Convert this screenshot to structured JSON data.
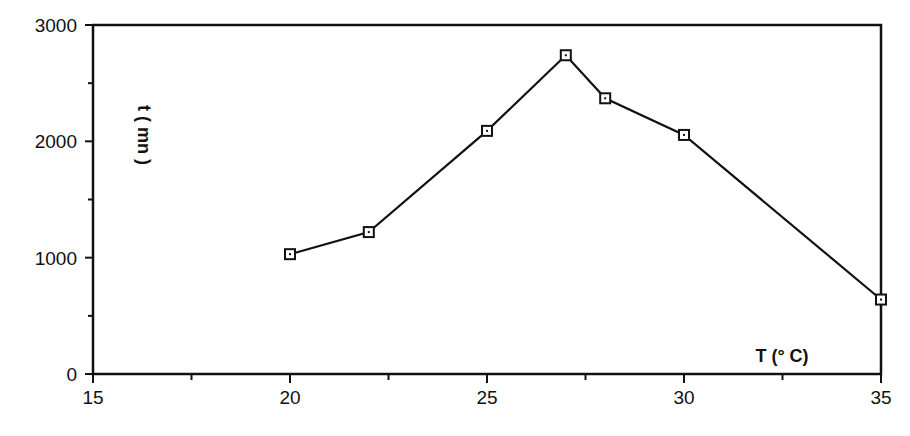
{
  "chart_data": {
    "type": "line",
    "title": "",
    "xlabel": "T (° C)",
    "ylabel": "t ( mn )",
    "xlim": [
      15,
      35
    ],
    "ylim": [
      0,
      3000
    ],
    "x_ticks": [
      15,
      20,
      25,
      30,
      35
    ],
    "x_minor_ticks": [
      17.5,
      22.5,
      27.5,
      32.5
    ],
    "y_ticks": [
      0,
      1000,
      2000,
      3000
    ],
    "y_minor_ticks": [
      500,
      1500,
      2500
    ],
    "grid": false,
    "legend": null,
    "marker": "square",
    "series": [
      {
        "name": "t vs T",
        "x": [
          20,
          22,
          25,
          27,
          28,
          30,
          35
        ],
        "values": [
          1030,
          1220,
          2090,
          2740,
          2370,
          2055,
          640
        ]
      }
    ]
  },
  "colors": {
    "line": "#111111",
    "axis": "#111111",
    "background": "#ffffff"
  }
}
